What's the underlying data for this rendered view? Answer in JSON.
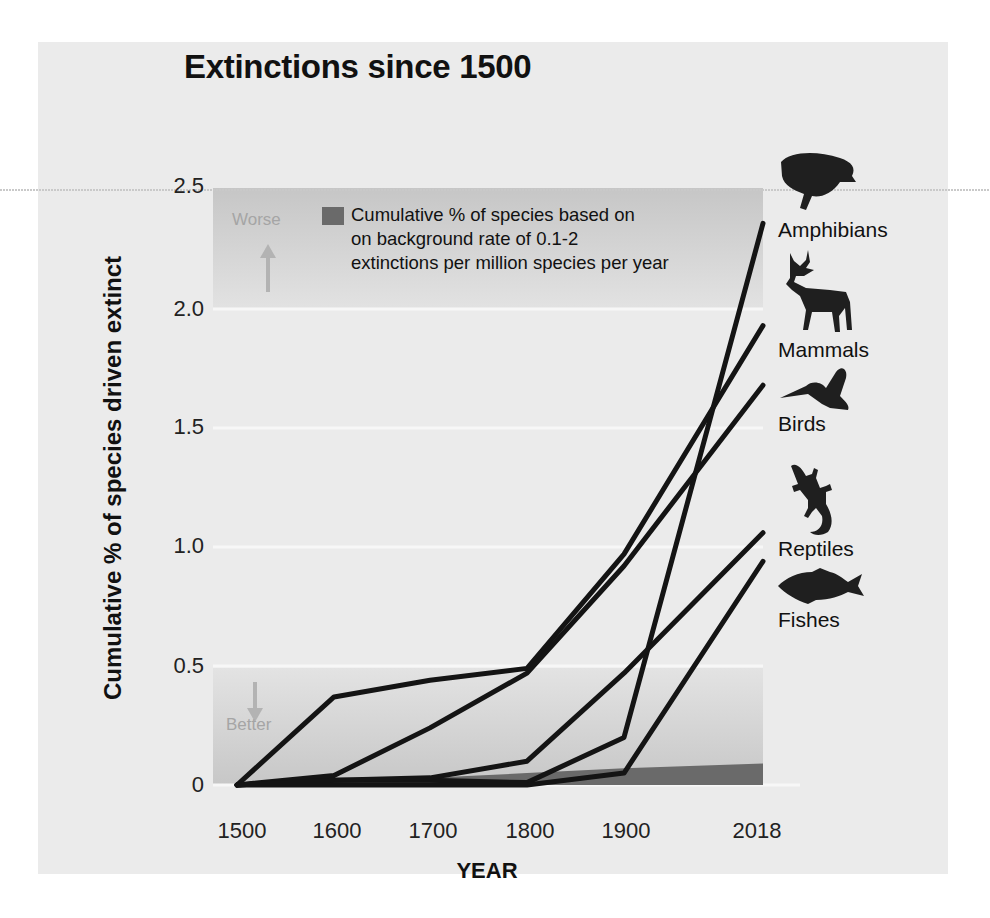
{
  "chart_data": {
    "type": "line",
    "title": "Extinctions since 1500",
    "xlabel": "YEAR",
    "ylabel": "Cumulative % of species driven extinct",
    "x": [
      1500,
      1600,
      1700,
      1800,
      1900,
      2018
    ],
    "x_tick_labels": [
      "1500",
      "1600",
      "1700",
      "1800",
      "1900",
      "2018"
    ],
    "y_tick_labels": [
      "0",
      "0.5",
      "1.0",
      "1.5",
      "2.0",
      "2.5"
    ],
    "ylim": [
      0,
      2.5
    ],
    "grid": true,
    "legend_position": "upper-left inside plot",
    "series": [
      {
        "name": "Amphibians",
        "values": [
          0,
          0.02,
          0.02,
          0.01,
          0.2,
          2.36
        ]
      },
      {
        "name": "Mammals",
        "values": [
          0,
          0.37,
          0.44,
          0.49,
          0.97,
          1.93
        ]
      },
      {
        "name": "Birds",
        "values": [
          0,
          0.04,
          0.24,
          0.47,
          0.92,
          1.68
        ]
      },
      {
        "name": "Reptiles",
        "values": [
          0,
          0.02,
          0.03,
          0.1,
          0.47,
          1.06
        ]
      },
      {
        "name": "Fishes",
        "values": [
          0,
          0.0,
          0.0,
          0.0,
          0.05,
          0.94
        ]
      }
    ],
    "background_rate": {
      "label": "Cumulative % of species based on on background rate of 0.1-2 extinctions per million species per year",
      "values": [
        0,
        0.02,
        0.03,
        0.05,
        0.07,
        0.09
      ],
      "color": "#6a6a6a"
    },
    "annotations": [
      "Worse",
      "Better"
    ]
  },
  "labels": {
    "legend_lines": [
      "Cumulative % of species based on",
      "on background rate of 0.1-2",
      "extinctions per million species per year"
    ],
    "worse": "Worse",
    "better": "Better"
  },
  "icons": [
    "frog-icon",
    "deer-icon",
    "hummingbird-icon",
    "lizard-icon",
    "fish-icon"
  ]
}
